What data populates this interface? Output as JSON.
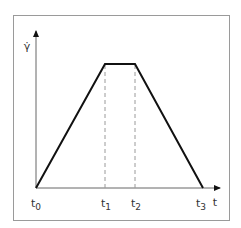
{
  "diagram": {
    "y_axis_label": "γ̇",
    "x_axis_label": "t",
    "time_labels": [
      {
        "base": "t",
        "sub": "0"
      },
      {
        "base": "t",
        "sub": "1"
      },
      {
        "base": "t",
        "sub": "2"
      },
      {
        "base": "t",
        "sub": "3"
      }
    ],
    "colors": {
      "frame": "#9a9a9a",
      "curve": "#111111",
      "dashed": "#9a9a9a",
      "axis": "#666666",
      "text": "#333333"
    }
  }
}
